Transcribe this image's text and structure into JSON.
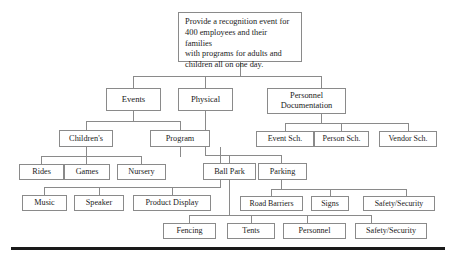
{
  "diagram": {
    "type": "work-breakdown-structure",
    "title_text": "Provide a recognition event for 400 employees and their families with programs for adults and children all on one day.",
    "line_color": "#8a8a8a",
    "text_color": "#1b1b1b",
    "baseline_color": "#1a1a1a",
    "background": "#ffffff"
  },
  "nodes": {
    "root": "Provide a recognition event for\n400 employees and their families\nwith programs for adults and\nchildren all on one day.",
    "events": "Events",
    "physical": "Physical",
    "personnel_documentation": "Personnel\nDocumentation",
    "childrens": "Children's",
    "program": "Program",
    "event_sch": "Event Sch.",
    "person_sch": "Person Sch.",
    "vendor_sch": "Vendor Sch.",
    "rides": "Rides",
    "games": "Games",
    "nursery": "Nursery",
    "ball_park": "Ball Park",
    "parking": "Parking",
    "music": "Music",
    "speaker": "Speaker",
    "product_display": "Product Display",
    "road_barriers": "Road Barriers",
    "signs": "Signs",
    "safety_security_parking": "Safety/Security",
    "fencing": "Fencing",
    "tents": "Tents",
    "personnel": "Personnel",
    "safety_security_ballpark": "Safety/Security"
  }
}
